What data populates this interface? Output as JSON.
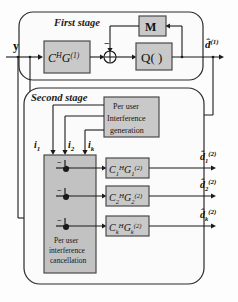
{
  "figure": {
    "type": "block-diagram"
  },
  "stages": {
    "first": {
      "label": "First stage",
      "blocks": [
        {
          "id": "match-filter",
          "label": "C",
          "sup": "H",
          "label2": "G",
          "sup2": "(1)"
        },
        {
          "id": "memory",
          "label": "M"
        },
        {
          "id": "quantizer",
          "label": "Q( )"
        }
      ],
      "sum_sign": "−",
      "sum_symbol": "⊕"
    },
    "second": {
      "label": "Second stage",
      "interference_gen": {
        "line1": "Per user",
        "line2": "Interference",
        "line3": "generation"
      },
      "cancellation": {
        "line1": "Per user",
        "line2": "interference",
        "line3": "cancellation",
        "sum_sign": "−"
      },
      "filters": [
        {
          "label": "C",
          "sub": "1",
          "sup": "H",
          "label2": "G",
          "sub2": "1",
          "sup2": "(2)"
        },
        {
          "label": "C",
          "sub": "2",
          "sup": "H",
          "label2": "G",
          "sub2": "2",
          "sup2": "(2)"
        },
        {
          "label": "C",
          "sub": "k",
          "sup": "H",
          "label2": "G",
          "sub2": "k",
          "sup2": "(2)"
        }
      ]
    }
  },
  "signals": {
    "input": {
      "name": "y",
      "label": "y"
    },
    "interference": [
      {
        "base": "i",
        "sub": "1"
      },
      {
        "base": "i",
        "sub": "2"
      },
      {
        "base": "i",
        "sub": "k"
      }
    ],
    "first_output": {
      "base": "d",
      "hat": "̂",
      "sub": "",
      "sup": "(1)"
    },
    "second_outputs": [
      {
        "base": "d",
        "hat": "̂",
        "sub": "1",
        "sup": "(2)"
      },
      {
        "base": "d",
        "hat": "̂",
        "sub": "2",
        "sup": "(2)"
      },
      {
        "base": "d",
        "hat": "̂",
        "sub": "k",
        "sup": "(2)"
      }
    ]
  },
  "colors": {
    "background": "#fdfdfd",
    "line": "#1a1a1a",
    "block_fill": "#c9c9c9",
    "block_stroke": "#4a4a4a",
    "panel_fill": "#fbfbfb",
    "panel_stroke": "#2b2b2b",
    "cancel_fill": "#c2c2c2",
    "text": "#111111"
  }
}
